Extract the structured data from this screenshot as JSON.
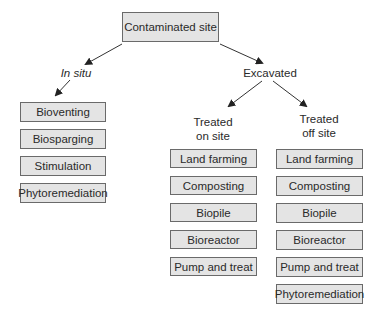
{
  "diagram": {
    "root": {
      "label": "Contaminated site"
    },
    "branches": {
      "in_situ": {
        "label": "In situ",
        "methods": [
          "Bioventing",
          "Biosparging",
          "Stimulation",
          "Phytoremediation"
        ]
      },
      "excavated": {
        "label": "Excavated",
        "on_site": {
          "label_line1": "Treated",
          "label_line2": "on site",
          "methods": [
            "Land farming",
            "Composting",
            "Biopile",
            "Bioreactor",
            "Pump and treat"
          ]
        },
        "off_site": {
          "label_line1": "Treated",
          "label_line2": "off site",
          "methods": [
            "Land farming",
            "Composting",
            "Biopile",
            "Bioreactor",
            "Pump and treat",
            "Phytoremediation"
          ]
        }
      }
    },
    "colors": {
      "box_fill": "#e4e4e4",
      "box_border": "#6a6a6a",
      "arrow": "#222222"
    }
  }
}
